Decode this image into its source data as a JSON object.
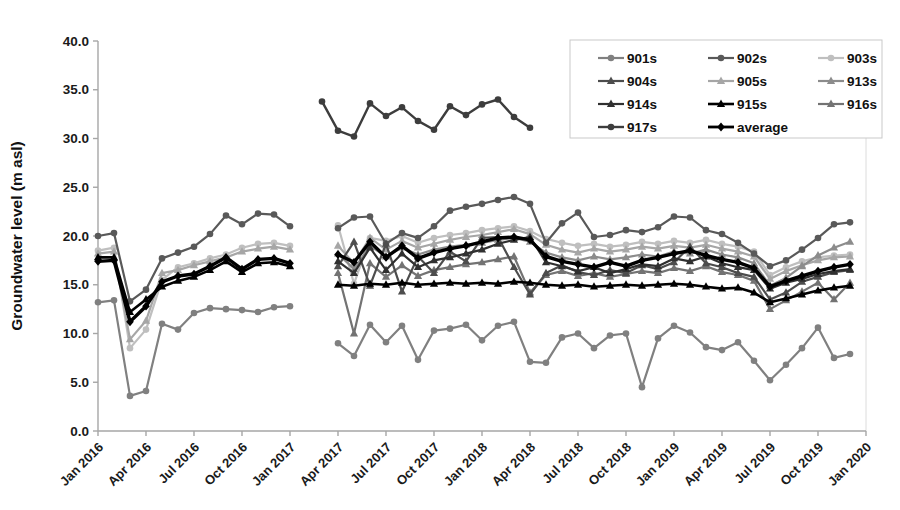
{
  "chart_data": {
    "type": "line",
    "title": "",
    "xlabel": "",
    "ylabel": "Groundwater level (m asl)",
    "ylim": [
      0,
      40
    ],
    "y_tick_step": 5,
    "y_ticks": [
      "0.0",
      "5.0",
      "10.0",
      "15.0",
      "20.0",
      "25.0",
      "30.0",
      "35.0",
      "40.0"
    ],
    "x_ticks": [
      "Jan 2016",
      "Apr 2016",
      "Jul 2016",
      "Oct 2016",
      "Jan 2017",
      "Apr 2017",
      "Jul 2017",
      "Oct 2017",
      "Jan 2018",
      "Apr 2018",
      "Jul 2018",
      "Oct 2018",
      "Jan 2019",
      "Apr 2019",
      "Jul 2019",
      "Oct 2019",
      "Jan 2020"
    ],
    "x_axis": {
      "start_label": "Jan 2016",
      "end_label": "Jan 2020",
      "months_total": 48,
      "tick_every_months": 3
    },
    "grid": false,
    "legend_position": "top-right",
    "legend_columns": 3,
    "note": "monthly data; gap Feb 2017 - Mar 2017 for most wells",
    "series": [
      {
        "name": "901s",
        "color": "#808080",
        "marker": "circle",
        "width": 2.2,
        "segments": [
          {
            "start_label": "Jan 2016",
            "start_month_index": 0,
            "values": [
              13.2,
              13.4,
              3.6,
              4.1,
              11.0,
              10.4,
              12.1,
              12.6,
              12.5,
              12.4,
              12.2,
              12.7,
              12.8
            ]
          },
          {
            "start_label": "Apr 2017",
            "start_month_index": 15,
            "values": [
              9.0,
              7.7,
              10.9,
              9.1,
              10.8,
              7.3,
              10.3,
              10.5,
              10.9,
              9.3,
              10.8,
              11.2,
              7.1,
              7.0,
              9.6,
              10.0,
              8.5,
              9.8,
              10.0,
              4.5,
              9.5,
              10.8,
              10.1,
              8.6,
              8.3,
              9.1,
              7.2,
              5.2,
              6.8,
              8.5,
              10.6,
              7.5,
              7.9
            ]
          }
        ]
      },
      {
        "name": "902s",
        "color": "#595959",
        "marker": "circle",
        "width": 2.2,
        "segments": [
          {
            "start_label": "Jan 2016",
            "start_month_index": 0,
            "values": [
              20.0,
              20.3,
              13.3,
              14.5,
              17.7,
              18.3,
              18.9,
              20.2,
              22.1,
              21.2,
              22.3,
              22.2,
              21.0
            ]
          },
          {
            "start_label": "Apr 2017",
            "start_month_index": 15,
            "values": [
              20.8,
              21.9,
              22.0,
              19.2,
              20.3,
              19.8,
              21.0,
              22.6,
              23.0,
              23.3,
              23.7,
              24.0,
              23.3,
              19.3,
              21.3,
              22.4,
              19.9,
              20.1,
              20.6,
              20.4,
              20.9,
              22.0,
              21.9,
              20.6,
              20.2,
              19.3,
              18.2,
              16.9,
              17.5,
              18.6,
              19.8,
              21.2,
              21.4
            ]
          }
        ]
      },
      {
        "name": "903s",
        "color": "#bfbfbf",
        "marker": "circle",
        "width": 2.2,
        "segments": [
          {
            "start_label": "Jan 2016",
            "start_month_index": 0,
            "values": [
              18.5,
              18.8,
              8.5,
              10.4,
              15.5,
              16.8,
              17.2,
              17.7,
              18.1,
              18.8,
              19.2,
              19.3,
              19.0
            ]
          },
          {
            "start_label": "Apr 2017",
            "start_month_index": 15,
            "values": [
              21.1,
              15.1,
              19.8,
              19.5,
              20.0,
              19.3,
              19.8,
              20.1,
              20.3,
              20.6,
              20.8,
              21.0,
              20.5,
              19.7,
              19.3,
              19.0,
              19.2,
              18.9,
              19.1,
              19.4,
              19.2,
              19.5,
              19.3,
              19.6,
              19.2,
              18.9,
              18.4,
              16.0,
              16.8,
              17.4,
              17.8,
              18.0,
              18.1
            ]
          }
        ]
      },
      {
        "name": "904s",
        "color": "#4d4d4d",
        "marker": "triangle",
        "width": 2.2,
        "segments": [
          {
            "start_label": "Apr 2017",
            "start_month_index": 15,
            "values": [
              16.9,
              19.4,
              14.9,
              19.2,
              14.3,
              17.9,
              16.2,
              18.4,
              17.4,
              19.8,
              19.9,
              16.8,
              14.0,
              16.2,
              17.0,
              16.3,
              16.0,
              16.5,
              16.2,
              17.0,
              16.6,
              17.3,
              18.9,
              17.2,
              16.8,
              16.2,
              15.8,
              13.5,
              14.2,
              15.3,
              15.8,
              16.3,
              16.5
            ]
          }
        ]
      },
      {
        "name": "905s",
        "color": "#a6a6a6",
        "marker": "triangle",
        "width": 2.2,
        "segments": [
          {
            "start_label": "Jan 2016",
            "start_month_index": 0,
            "values": [
              18.2,
              18.4,
              9.4,
              11.3,
              16.2,
              16.5,
              17.0,
              17.4,
              17.8,
              18.4,
              18.7,
              18.9,
              18.6
            ]
          },
          {
            "start_label": "Apr 2017",
            "start_month_index": 15,
            "values": [
              19.0,
              17.2,
              19.8,
              18.6,
              19.5,
              18.8,
              19.2,
              19.6,
              19.9,
              20.1,
              20.4,
              20.7,
              20.2,
              19.1,
              18.6,
              18.3,
              18.7,
              18.4,
              18.6,
              18.9,
              18.7,
              19.0,
              18.8,
              19.1,
              18.7,
              18.4,
              17.9,
              15.6,
              16.4,
              17.0,
              17.5,
              17.8,
              17.9
            ]
          }
        ]
      },
      {
        "name": "913s",
        "color": "#8c8c8c",
        "marker": "triangle",
        "width": 2.2,
        "segments": [
          {
            "start_label": "Apr 2017",
            "start_month_index": 15,
            "values": [
              18.2,
              16.6,
              19.0,
              17.9,
              18.8,
              18.1,
              18.6,
              18.9,
              19.1,
              19.3,
              19.6,
              19.8,
              19.4,
              18.3,
              17.8,
              17.5,
              17.9,
              17.6,
              17.8,
              18.1,
              17.9,
              18.4,
              18.2,
              18.6,
              18.1,
              17.8,
              17.2,
              14.9,
              15.7,
              16.9,
              18.0,
              18.8,
              19.4
            ]
          }
        ]
      },
      {
        "name": "914s",
        "color": "#303030",
        "marker": "triangle",
        "width": 2.2,
        "segments": [
          {
            "start_label": "Apr 2017",
            "start_month_index": 15,
            "values": [
              17.4,
              16.2,
              18.8,
              16.5,
              18.2,
              16.8,
              17.5,
              17.8,
              18.2,
              18.6,
              19.2,
              19.6,
              19.9,
              17.3,
              16.9,
              16.4,
              16.8,
              16.2,
              16.6,
              17.1,
              16.9,
              17.7,
              17.4,
              17.9,
              17.2,
              16.8,
              16.5,
              14.6,
              15.2,
              15.6,
              16.1,
              16.4,
              16.6
            ]
          }
        ]
      },
      {
        "name": "915s",
        "color": "#000000",
        "marker": "triangle",
        "width": 2.6,
        "segments": [
          {
            "start_label": "Jan 2016",
            "start_month_index": 0,
            "values": [
              17.8,
              17.8,
              12.2,
              13.5,
              14.8,
              15.4,
              15.8,
              16.5,
              17.4,
              16.3,
              17.2,
              17.3,
              16.9
            ]
          },
          {
            "start_label": "Apr 2017",
            "start_month_index": 15,
            "values": [
              15.0,
              14.9,
              15.1,
              15.0,
              15.2,
              15.0,
              15.1,
              15.2,
              15.1,
              15.2,
              15.1,
              15.3,
              15.2,
              15.0,
              14.9,
              15.0,
              14.8,
              14.9,
              15.0,
              14.9,
              15.0,
              15.1,
              15.0,
              14.8,
              14.6,
              14.7,
              14.2,
              13.2,
              13.6,
              14.0,
              14.4,
              14.7,
              14.9
            ]
          }
        ]
      },
      {
        "name": "916s",
        "color": "#737373",
        "marker": "triangle",
        "width": 2.2,
        "segments": [
          {
            "start_label": "Apr 2017",
            "start_month_index": 15,
            "values": [
              16.2,
              10.0,
              17.2,
              15.8,
              17.0,
              15.9,
              16.5,
              16.8,
              17.1,
              17.3,
              17.6,
              17.9,
              14.2,
              16.0,
              16.4,
              15.9,
              16.2,
              15.8,
              16.1,
              16.4,
              16.2,
              16.7,
              16.4,
              16.9,
              16.3,
              16.0,
              15.4,
              12.5,
              13.4,
              14.3,
              15.2,
              13.5,
              15.2
            ]
          }
        ]
      },
      {
        "name": "917s",
        "color": "#3d3d3d",
        "marker": "circle",
        "width": 2.4,
        "segments": [
          {
            "start_label": "Mar 2017",
            "start_month_index": 14,
            "values": [
              33.8,
              30.8,
              30.2,
              33.6,
              32.3,
              33.2,
              31.8,
              30.9,
              33.3,
              32.4,
              33.5,
              34.0,
              32.2,
              31.1
            ]
          }
        ]
      },
      {
        "name": "average",
        "color": "#000000",
        "marker": "diamond",
        "width": 3.4,
        "segments": [
          {
            "start_label": "Jan 2016",
            "start_month_index": 0,
            "values": [
              17.4,
              17.5,
              11.2,
              12.8,
              15.3,
              15.9,
              16.1,
              16.9,
              17.8,
              16.6,
              17.6,
              17.7,
              17.2
            ]
          },
          {
            "start_label": "Apr 2017",
            "start_month_index": 15,
            "values": [
              18.1,
              17.3,
              19.4,
              17.8,
              19.0,
              17.7,
              18.3,
              18.7,
              19.0,
              19.4,
              19.8,
              19.9,
              19.6,
              17.9,
              17.4,
              17.1,
              16.8,
              17.3,
              16.9,
              17.5,
              17.8,
              18.2,
              18.5,
              18.0,
              17.6,
              17.3,
              16.7,
              14.8,
              15.4,
              15.9,
              16.4,
              16.8,
              17.1
            ]
          }
        ]
      }
    ]
  }
}
